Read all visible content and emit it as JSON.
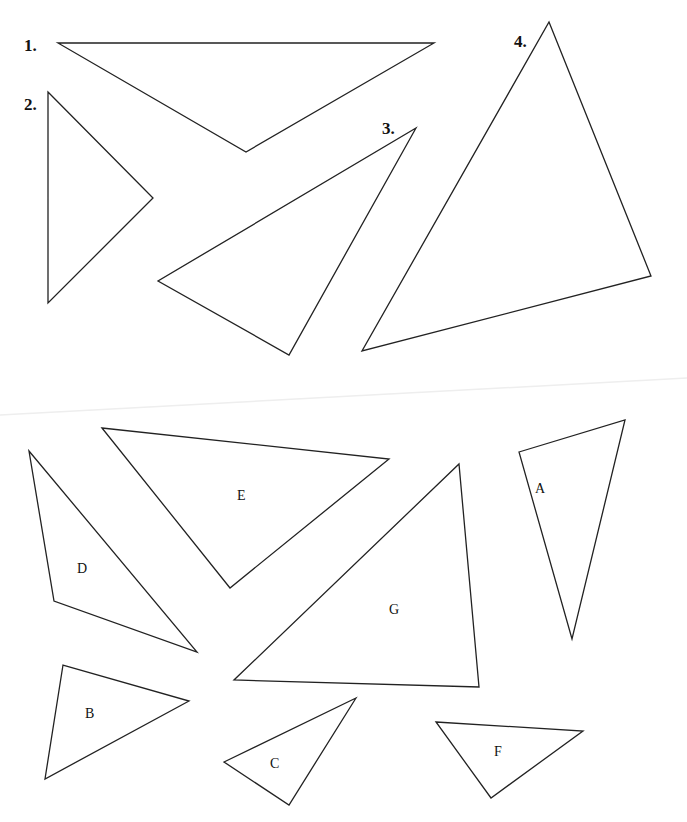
{
  "numbered_triangles": [
    {
      "label": "1.",
      "label_pos": [
        24,
        51
      ],
      "points": [
        [
          58,
          43
        ],
        [
          434,
          43
        ],
        [
          246,
          152
        ]
      ]
    },
    {
      "label": "2.",
      "label_pos": [
        24,
        110
      ],
      "points": [
        [
          48,
          92
        ],
        [
          153,
          198
        ],
        [
          48,
          303
        ]
      ]
    },
    {
      "label": "3.",
      "label_pos": [
        382,
        134
      ],
      "points": [
        [
          416,
          128
        ],
        [
          289,
          355
        ],
        [
          158,
          281
        ]
      ]
    },
    {
      "label": "4.",
      "label_pos": [
        514,
        47
      ],
      "points": [
        [
          549,
          22
        ],
        [
          651,
          276
        ],
        [
          362,
          351
        ]
      ]
    }
  ],
  "lettered_triangles": [
    {
      "label": "E",
      "label_pos": [
        237,
        500
      ],
      "points": [
        [
          102,
          428
        ],
        [
          389,
          459
        ],
        [
          230,
          588
        ]
      ]
    },
    {
      "label": "D",
      "label_pos": [
        77,
        573
      ],
      "points": [
        [
          29,
          451
        ],
        [
          197,
          652
        ],
        [
          54,
          601
        ]
      ]
    },
    {
      "label": "A",
      "label_pos": [
        535,
        493
      ],
      "points": [
        [
          519,
          452
        ],
        [
          625,
          420
        ],
        [
          572,
          639
        ]
      ]
    },
    {
      "label": "G",
      "label_pos": [
        389,
        614
      ],
      "points": [
        [
          459,
          464
        ],
        [
          479,
          687
        ],
        [
          234,
          680
        ]
      ]
    },
    {
      "label": "B",
      "label_pos": [
        85,
        718
      ],
      "points": [
        [
          63,
          665
        ],
        [
          189,
          701
        ],
        [
          45,
          779
        ]
      ]
    },
    {
      "label": "C",
      "label_pos": [
        270,
        768
      ],
      "points": [
        [
          356,
          698
        ],
        [
          289,
          805
        ],
        [
          224,
          762
        ]
      ]
    },
    {
      "label": "F",
      "label_pos": [
        494,
        756
      ],
      "points": [
        [
          436,
          722
        ],
        [
          583,
          731
        ],
        [
          491,
          798
        ]
      ]
    }
  ],
  "fold_line": [
    [
      0,
      415
    ],
    [
      687,
      378
    ]
  ]
}
